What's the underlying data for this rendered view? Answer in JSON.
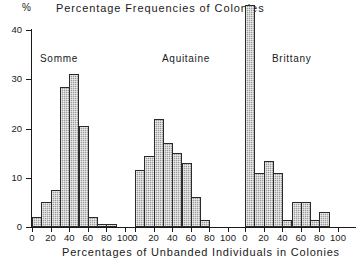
{
  "title": "Percentage Frequencies of Colonies",
  "y_axis_unit": "%",
  "x_axis_title": "Percentages of Unbanded Individuals in Colonies",
  "y_ticks": [
    "0",
    "10",
    "20",
    "30",
    "40"
  ],
  "x_ticks": [
    "0",
    "20",
    "40",
    "60",
    "80",
    "100"
  ],
  "panel_labels": [
    "Somme",
    "Aquitaine",
    "Brittany"
  ],
  "colors": {
    "bar_fill": "#9b9b9b",
    "bar_edge": "#2a2a2a",
    "axis": "#1a1a1a",
    "background": "#ffffff"
  },
  "chart_data": {
    "type": "bar",
    "title": "Percentage Frequencies of Colonies",
    "xlabel": "Percentages of Unbanded Individuals in Colonies",
    "ylabel": "%",
    "ylim": [
      0,
      45
    ],
    "xlim": [
      0,
      100
    ],
    "grid": false,
    "legend": "none",
    "panel_layout": "three side-by-side histograms sharing one y-axis",
    "bin_width": 10,
    "bin_centers": [
      5,
      15,
      25,
      35,
      45,
      55,
      65,
      75,
      85,
      95
    ],
    "panels": [
      {
        "name": "Somme",
        "categories": [
          "0-10",
          "10-20",
          "20-30",
          "30-40",
          "40-50",
          "50-60",
          "60-70",
          "70-80",
          "80-90",
          "90-100"
        ],
        "values": [
          2,
          5,
          7.5,
          28.5,
          31,
          20.5,
          2,
          0.7,
          0.7,
          0
        ]
      },
      {
        "name": "Aquitaine",
        "categories": [
          "0-10",
          "10-20",
          "20-30",
          "30-40",
          "40-50",
          "50-60",
          "60-70",
          "70-80",
          "80-90",
          "90-100"
        ],
        "values": [
          11.5,
          14.5,
          22,
          17,
          15,
          13,
          6,
          1.5,
          0,
          0
        ]
      },
      {
        "name": "Brittany",
        "categories": [
          "0-10",
          "10-20",
          "20-30",
          "30-40",
          "40-50",
          "50-60",
          "60-70",
          "70-80",
          "80-90",
          "90-100"
        ],
        "values": [
          45,
          11,
          13.5,
          11,
          1.5,
          5,
          5,
          1.5,
          3,
          0
        ]
      }
    ]
  }
}
